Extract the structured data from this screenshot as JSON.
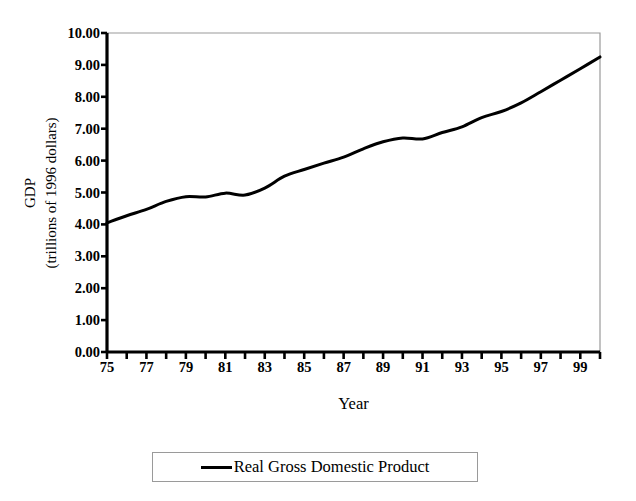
{
  "chart_data": {
    "type": "line",
    "title": "",
    "xlabel": "Year",
    "ylabel_line1": "GDP",
    "ylabel_line2": "(trillions of 1996 dollars)",
    "xlim": [
      1975,
      2000
    ],
    "ylim": [
      0.0,
      10.0
    ],
    "grid": false,
    "legend_position": "bottom",
    "y_ticks": [
      "0.00",
      "1.00",
      "2.00",
      "3.00",
      "4.00",
      "5.00",
      "6.00",
      "7.00",
      "8.00",
      "9.00",
      "10.00"
    ],
    "y_tick_values": [
      0,
      1,
      2,
      3,
      4,
      5,
      6,
      7,
      8,
      9,
      10
    ],
    "x_tick_labels": [
      "75",
      "77",
      "79",
      "81",
      "83",
      "85",
      "87",
      "89",
      "91",
      "93",
      "95",
      "97",
      "99"
    ],
    "x_tick_values": [
      1975,
      1977,
      1979,
      1981,
      1983,
      1985,
      1987,
      1989,
      1991,
      1993,
      1995,
      1997,
      1999
    ],
    "x_minor_ticks": [
      1975,
      1976,
      1977,
      1978,
      1979,
      1980,
      1981,
      1982,
      1983,
      1984,
      1985,
      1986,
      1987,
      1988,
      1989,
      1990,
      1991,
      1992,
      1993,
      1994,
      1995,
      1996,
      1997,
      1998,
      1999,
      2000
    ],
    "line_color": "#000000",
    "line_width": 3,
    "series": [
      {
        "name": "Real Gross Domestic Product",
        "x": [
          1975,
          1976,
          1977,
          1978,
          1979,
          1980,
          1981,
          1982,
          1983,
          1984,
          1985,
          1986,
          1987,
          1988,
          1989,
          1990,
          1991,
          1992,
          1993,
          1994,
          1995,
          1996,
          1997,
          1998,
          1999,
          2000
        ],
        "values": [
          4.05,
          4.27,
          4.47,
          4.72,
          4.87,
          4.86,
          4.98,
          4.92,
          5.14,
          5.51,
          5.72,
          5.92,
          6.11,
          6.37,
          6.59,
          6.71,
          6.68,
          6.88,
          7.06,
          7.35,
          7.54,
          7.81,
          8.16,
          8.52,
          8.88,
          9.25
        ]
      }
    ],
    "annotations": []
  },
  "legend": {
    "entries": [
      {
        "label": "Real Gross Domestic Product",
        "color": "#000000"
      }
    ]
  },
  "axes": {
    "frame_color": "#9a9a9a",
    "axis_color": "#000000"
  }
}
